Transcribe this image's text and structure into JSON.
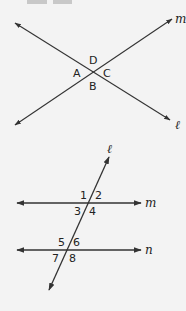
{
  "top_blocks": [
    {
      "left": 27,
      "width": 20
    },
    {
      "left": 53,
      "width": 19
    }
  ],
  "diagram1": {
    "lines": {
      "l": {
        "label": "ℓ",
        "x1": 15,
        "y1": 23,
        "x2": 170,
        "y2": 120
      },
      "m": {
        "label": "m",
        "x1": 15,
        "y1": 125,
        "x2": 172,
        "y2": 19
      }
    },
    "intersection": {
      "x": 93,
      "y": 71
    },
    "angle_labels": {
      "top": "D",
      "left": "A",
      "right": "C",
      "bottom": "B"
    }
  },
  "diagram2": {
    "lines": {
      "m": {
        "label": "m",
        "y": 203
      },
      "n": {
        "label": "n",
        "y": 250
      },
      "transversal": {
        "label": "ℓ"
      }
    },
    "angle_labels": {
      "a1": "1",
      "a2": "2",
      "a3": "3",
      "a4": "4",
      "a5": "5",
      "a6": "6",
      "a7": "7",
      "a8": "8"
    }
  },
  "colors": {
    "background": "#f3f3f3",
    "line": "#333333",
    "block": "#c8c8c8"
  }
}
